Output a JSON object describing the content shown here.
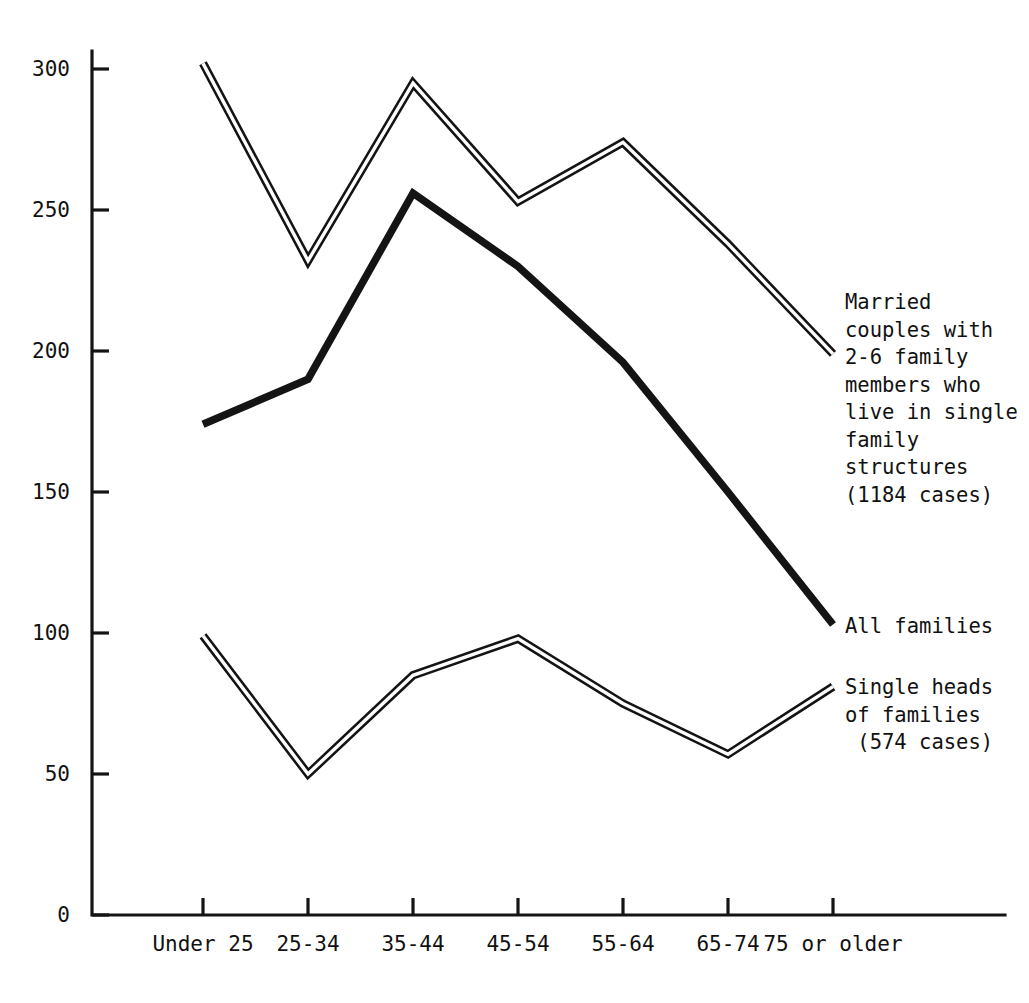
{
  "chart_data": {
    "type": "line",
    "title": "",
    "subtitle": "",
    "xlabel": "",
    "ylabel": "",
    "categories": [
      "Under 25",
      "25-34",
      "35-44",
      "45-54",
      "55-64",
      "65-74",
      "75 or older"
    ],
    "ylim": [
      0,
      300
    ],
    "yticks": [
      0,
      50,
      100,
      150,
      200,
      250,
      300
    ],
    "ytick_labels": [
      "0",
      "50",
      "100",
      "150",
      "200",
      "250",
      "300"
    ],
    "grid": false,
    "legend_position": "right-inline-at-line-end",
    "series": [
      {
        "name": "Married couples with 2-6 family members who live in single family structures (1184 cases)",
        "style": "double-outline",
        "values": [
          302,
          232,
          295,
          253,
          274,
          238,
          199
        ]
      },
      {
        "name": "All families",
        "style": "solid-thick",
        "values": [
          174,
          190,
          256,
          230,
          196,
          150,
          103
        ]
      },
      {
        "name": "Single heads of families (574 cases)",
        "style": "double-outline",
        "values": [
          99,
          50,
          85,
          98,
          75,
          57,
          81
        ]
      }
    ],
    "annotations": [
      "Married\ncouples with\n2-6 family\nmembers who\nlive in single\nfamily\nstructures\n(1184 cases)",
      "All families",
      "Single heads\nof families\n (574 cases)"
    ]
  },
  "axes": {
    "y_tick_labels": [
      "300",
      "250",
      "200",
      "150",
      "100",
      "50",
      "0"
    ],
    "x_tick_labels": [
      "Under 25",
      "25-34",
      "35-44",
      "45-54",
      "55-64",
      "65-74",
      "75 or older"
    ]
  },
  "legend": {
    "married_label": "Married\ncouples with\n2-6 family\nmembers who\nlive in single\nfamily\nstructures\n(1184 cases)",
    "all_families_label": "All families",
    "single_heads_label": "Single heads\nof families\n (574 cases)"
  },
  "colors": {
    "ink": "#141414",
    "paper": "#ffffff"
  }
}
